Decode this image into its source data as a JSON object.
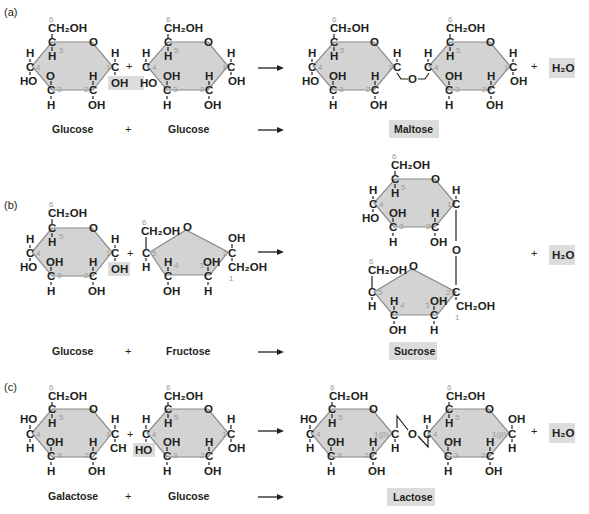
{
  "panels": [
    {
      "id": "a",
      "label": "(a)",
      "reactants": [
        "Glucose",
        "Glucose"
      ],
      "product": "Maltose",
      "byproduct": "H₂O",
      "operator": "+"
    },
    {
      "id": "b",
      "label": "(b)",
      "reactants": [
        "Glucose",
        "Fructose"
      ],
      "product": "Sucrose",
      "byproduct": "H₂O",
      "operator": "+"
    },
    {
      "id": "c",
      "label": "(c)",
      "reactants": [
        "Galactose",
        "Glucose"
      ],
      "product": "Lactose",
      "byproduct": "H₂O",
      "operator": "+"
    }
  ],
  "atoms": {
    "CH2OH": "CH₂OH",
    "C": "C",
    "O": "O",
    "H": "H",
    "OH": "OH",
    "HO": "HO",
    "CH": "CH",
    "beta": "1(β)"
  },
  "carbon_numbers": [
    "1",
    "2",
    "3",
    "4",
    "5",
    "6"
  ],
  "colors": {
    "ring_fill": "#d3d3d3",
    "highlight_fill": "#dcdcdc",
    "text": "#231f20",
    "carbon_number": "#9a9a9a"
  }
}
